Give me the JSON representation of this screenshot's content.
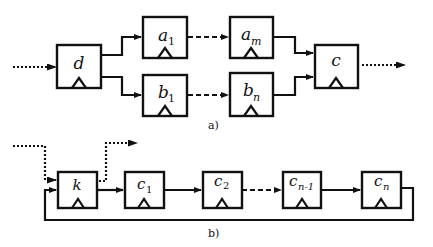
{
  "diagram_a": {
    "caption": "a)",
    "registers": [
      {
        "id": "d",
        "name": "d",
        "sub": ""
      },
      {
        "id": "a1",
        "name": "a",
        "sub": "1"
      },
      {
        "id": "am",
        "name": "a",
        "sub": "m"
      },
      {
        "id": "b1",
        "name": "b",
        "sub": "1"
      },
      {
        "id": "bn",
        "name": "b",
        "sub": "n"
      },
      {
        "id": "c",
        "name": "c",
        "sub": ""
      }
    ]
  },
  "diagram_b": {
    "caption": "b)",
    "registers": [
      {
        "id": "k",
        "name": "k",
        "sub": ""
      },
      {
        "id": "c1",
        "name": "c",
        "sub": "1"
      },
      {
        "id": "c2",
        "name": "c",
        "sub": "2"
      },
      {
        "id": "cn1",
        "name": "c",
        "sub": "n-1"
      },
      {
        "id": "cn",
        "name": "c",
        "sub": "n"
      }
    ]
  }
}
